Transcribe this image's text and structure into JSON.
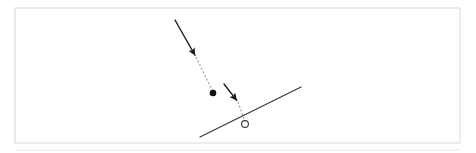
{
  "figure": {
    "background_color": "#ffffff",
    "frame": {
      "label": "figure-border",
      "stroke_color": "#d8d8d8",
      "stroke_width": 1,
      "x": 15,
      "y": 8,
      "width": 445,
      "height": 135
    },
    "baseline_rule": {
      "label": "bottom-rule",
      "stroke_color": "#e6e6e6",
      "y": 150,
      "x1": 15,
      "x2": 460
    }
  },
  "elements": {
    "velocity_arrow": {
      "name": "incoming-velocity-arrow",
      "kind": "solid-arrow",
      "color": "#1a1a1a",
      "stroke_width": 1.4,
      "x1": 175,
      "y1": 20,
      "x2": 196,
      "y2": 57,
      "arrowhead": "filled-triangle"
    },
    "trajectory_upper": {
      "name": "trajectory-dashed-upper",
      "kind": "dashed-line",
      "color": "#9a9a9a",
      "stroke_width": 1.1,
      "dash": "2 2",
      "x1": 196,
      "y1": 57,
      "x2": 213,
      "y2": 92
    },
    "particle_dot": {
      "name": "particle-dot",
      "kind": "filled-circle",
      "color": "#111111",
      "cx": 213,
      "cy": 93,
      "r": 3.3
    },
    "second_arrow": {
      "name": "impact-velocity-arrow",
      "kind": "solid-arrow",
      "color": "#1a1a1a",
      "stroke_width": 1.4,
      "x1": 224,
      "y1": 84,
      "x2": 238,
      "y2": 102,
      "arrowhead": "filled-triangle"
    },
    "trajectory_lower": {
      "name": "trajectory-dashed-lower",
      "kind": "dashed-line",
      "color": "#9a9a9a",
      "stroke_width": 1.1,
      "dash": "2 2",
      "x1": 238,
      "y1": 102,
      "x2": 244,
      "y2": 119
    },
    "inclined_plane": {
      "name": "inclined-plane-line",
      "kind": "solid-line",
      "color": "#3a3a3a",
      "stroke_width": 1.3,
      "x1": 200,
      "y1": 137,
      "x2": 301,
      "y2": 87
    },
    "landing_marker": {
      "name": "landing-point-circle",
      "kind": "open-circle",
      "color": "#3a3a3a",
      "stroke_width": 1.1,
      "cx": 245,
      "cy": 124,
      "r": 3.4
    }
  },
  "accessibility": {
    "description": "A line diagram showing an arrow descending from upper left, a dashed trajectory to a solid black dot, a second short arrow, a dashed segment, an inclined straight line, and a small open circle on the line."
  }
}
